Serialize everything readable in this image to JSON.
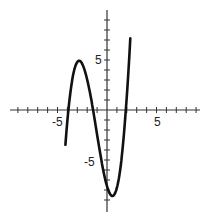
{
  "chart_data": {
    "type": "line",
    "title": "",
    "xlabel": "",
    "ylabel": "",
    "xlim": [
      -10,
      9
    ],
    "ylim": [
      -10,
      10
    ],
    "grid": false,
    "x_tick_labels": [
      {
        "value": -5,
        "label": "-5"
      },
      {
        "value": 5,
        "label": "5"
      }
    ],
    "y_tick_labels": [
      {
        "value": 5,
        "label": "5"
      },
      {
        "value": -5,
        "label": "-5"
      }
    ],
    "tick_spacing": 1,
    "series": [
      {
        "name": "cubic curve",
        "color": "#111111",
        "points": [
          [
            -4.2,
            -10
          ],
          [
            -3.9,
            0
          ],
          [
            -3.5,
            3.3
          ],
          [
            -3.0,
            4.6
          ],
          [
            -2.6,
            4.8
          ],
          [
            -2.2,
            4.4
          ],
          [
            -1.8,
            2.6
          ],
          [
            -1.4,
            0
          ],
          [
            -1.0,
            -3.2
          ],
          [
            -0.5,
            -6.5
          ],
          [
            0,
            -8.1
          ],
          [
            0.6,
            -8.7
          ],
          [
            1.0,
            -8.2
          ],
          [
            1.5,
            -5.0
          ],
          [
            1.9,
            0
          ],
          [
            2.3,
            10
          ]
        ],
        "approx_function": "f(x) ≈ 0.68(x+3.9)(x+1.4)(x-1.9)"
      }
    ],
    "local_max": [
      -2.6,
      4.8
    ],
    "local_min": [
      0.6,
      -8.7
    ],
    "x_intercepts": [
      -3.9,
      -1.4,
      1.9
    ]
  },
  "labels": {
    "x_neg5": "-5",
    "x_pos5": "5",
    "y_pos5": "5",
    "y_neg5": "-5"
  }
}
